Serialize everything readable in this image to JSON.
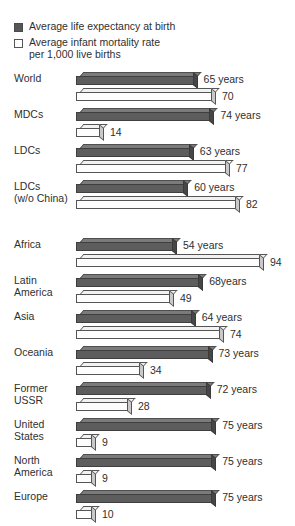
{
  "legend": {
    "items": [
      {
        "swatch": "dark-square-icon",
        "label": "Average life expectancy at birth",
        "color": "#575757"
      },
      {
        "swatch": "white-square-icon",
        "label": "Average infant mortality rate\nper 1,000 live births",
        "color": "#ffffff"
      }
    ]
  },
  "chart_data": {
    "type": "bar",
    "title": "",
    "subtitle": "",
    "xlabel": "",
    "ylabel": "",
    "orientation": "horizontal",
    "grid": false,
    "legend_position": "top-left",
    "categories": [
      "World",
      "MDCs",
      "LDCs",
      "LDCs\n(w/o China)",
      "Africa",
      "Latin\nAmerica",
      "Asia",
      "Oceania",
      "Former\nUSSR",
      "United\nStates",
      "North\nAmerica",
      "Europe"
    ],
    "series": [
      {
        "name": "Average life expectancy at birth",
        "unit": "years",
        "color": "#5d5d5d",
        "values": [
          65,
          74,
          63,
          60,
          54,
          68,
          64,
          73,
          72,
          75,
          75,
          75
        ],
        "labels": [
          "65 years",
          "74 years",
          "63 years",
          "60 years",
          "54 years",
          "68years",
          "64 years",
          "73 years",
          "72 years",
          "75 years",
          "75 years",
          "75 years"
        ]
      },
      {
        "name": "Average infant mortality rate per 1,000 live births",
        "unit": "per 1,000 live births",
        "color": "#fdfdfd",
        "values": [
          70,
          14,
          77,
          82,
          94,
          49,
          74,
          34,
          28,
          9,
          9,
          10
        ],
        "labels": [
          "70",
          "14",
          "77",
          "82",
          "94",
          "49",
          "74",
          "34",
          "28",
          "9",
          "9",
          "10"
        ]
      }
    ],
    "group_break_after_index": 3
  },
  "rows": [
    {
      "label": "World",
      "le_label": "65 years",
      "le_value": 65,
      "imr_label": "70",
      "imr_value": 70
    },
    {
      "label": "MDCs",
      "le_label": "74 years",
      "le_value": 74,
      "imr_label": "14",
      "imr_value": 14
    },
    {
      "label": "LDCs",
      "le_label": "63 years",
      "le_value": 63,
      "imr_label": "77",
      "imr_value": 77
    },
    {
      "label": "LDCs\n(w/o China)",
      "le_label": "60 years",
      "le_value": 60,
      "imr_label": "82",
      "imr_value": 82
    },
    {
      "label": "Africa",
      "le_label": "54 years",
      "le_value": 54,
      "imr_label": "94",
      "imr_value": 94
    },
    {
      "label": "Latin\nAmerica",
      "le_label": "68years",
      "le_value": 68,
      "imr_label": "49",
      "imr_value": 49
    },
    {
      "label": "Asia",
      "le_label": "64 years",
      "le_value": 64,
      "imr_label": "74",
      "imr_value": 74
    },
    {
      "label": "Oceania",
      "le_label": "73 years",
      "le_value": 73,
      "imr_label": "34",
      "imr_value": 34
    },
    {
      "label": "Former\nUSSR",
      "le_label": "72 years",
      "le_value": 72,
      "imr_label": "28",
      "imr_value": 28
    },
    {
      "label": "United\nStates",
      "le_label": "75 years",
      "le_value": 75,
      "imr_label": "9",
      "imr_value": 9
    },
    {
      "label": "North\nAmerica",
      "le_label": "75 years",
      "le_value": 75,
      "imr_label": "9",
      "imr_value": 9
    },
    {
      "label": "Europe",
      "le_label": "75 years",
      "le_value": 75,
      "imr_label": "10",
      "imr_value": 10
    }
  ],
  "scale": {
    "origin_x": 76,
    "le_px_per_unit": 1.87,
    "imr_px_per_unit": 2.0,
    "min_bar_px": 20,
    "value_gap_px": 6
  }
}
